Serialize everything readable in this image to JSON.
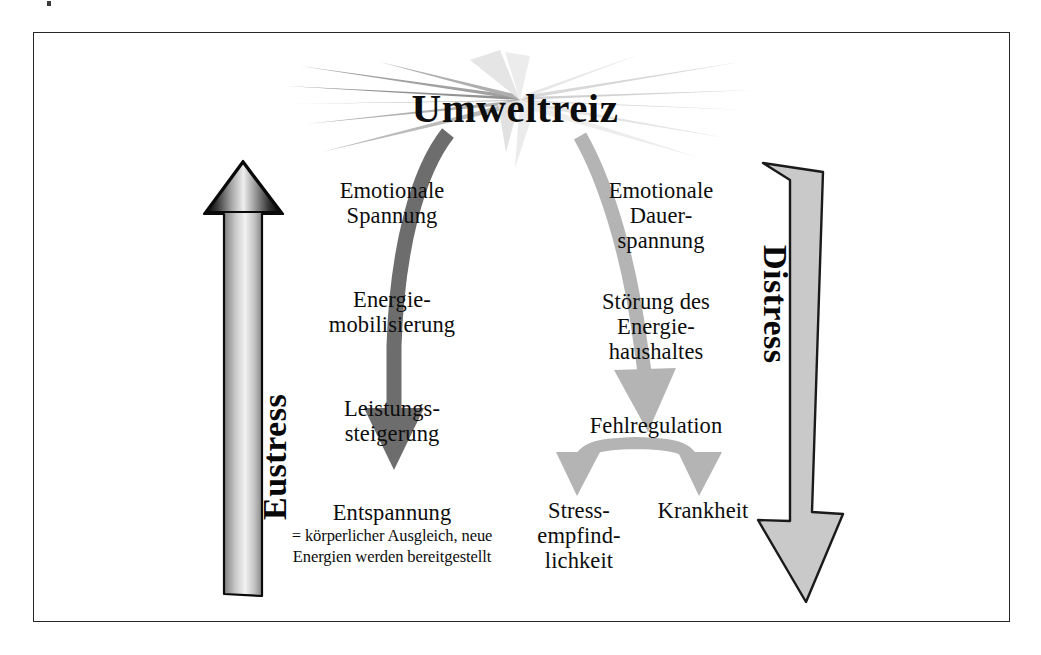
{
  "figure": {
    "title": "Umweltreiz",
    "left_axis_label": "Eustress",
    "right_axis_label": "Distress",
    "colors": {
      "frame": "#262626",
      "eustress_arrow_dark": "#111111",
      "eustress_arrow_light": "#e8e8e8",
      "distress_arrow_fill": "#c9c9c9",
      "distress_arrow_outline": "#1a1a1a",
      "left_path_arrow": "#6d6d6d",
      "right_path_arrow": "#b4b4b4",
      "burst_dark": "#8a8a8a",
      "burst_light": "#dcdcdc",
      "text": "#0d0d0d"
    }
  },
  "left_branch": {
    "name": "Eustress",
    "steps": [
      {
        "id": "emotionale-spannung",
        "text": "Emotionale\nSpannung"
      },
      {
        "id": "energiemobilisierung",
        "text": "Energie-\nmobilisierung"
      },
      {
        "id": "leistungssteigerung",
        "text": "Leistungs-\nsteigerung"
      },
      {
        "id": "entspannung",
        "text": "Entspannung"
      }
    ],
    "outcome_detail": "= körperlicher Ausgleich, neue\nEnergien werden bereitgestellt"
  },
  "right_branch": {
    "name": "Distress",
    "steps": [
      {
        "id": "emotionale-dauerspannung",
        "text": "Emotionale\nDauer-\nspannung"
      },
      {
        "id": "stoerung-energiehaushalt",
        "text": "Störung des\nEnergie-\nhaushaltes"
      },
      {
        "id": "fehlregulation",
        "text": "Fehlregulation"
      }
    ],
    "outcomes": [
      {
        "id": "stressempfindlichkeit",
        "text": "Stress-\nempfind-\nlichkeit"
      },
      {
        "id": "krankheit",
        "text": "Krankheit"
      }
    ]
  }
}
